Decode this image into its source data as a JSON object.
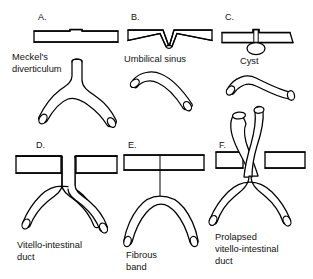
{
  "figure": {
    "background_color": "#ffffff",
    "ink_color": "#000000",
    "width": 313,
    "height": 279
  },
  "panels": [
    {
      "letter": "A.",
      "caption_line1": "Meckel's",
      "caption_line2": "diverticulum",
      "caption_full": "Meckel's diverticulum",
      "wall": "intact-hatched-wall-with-small-notch",
      "bowel": "y-shaped-loop-with-upward-diverticulum"
    },
    {
      "letter": "B.",
      "caption_line1": "Umbilical sinus",
      "caption_line2": "",
      "caption_full": "Umbilical sinus",
      "wall": "hatched-wall-with-v-shaped-invagination",
      "bowel": "elbow-shaped-bowel-loop"
    },
    {
      "letter": "C.",
      "caption_line1": "Cyst",
      "caption_line2": "",
      "caption_full": "Cyst",
      "wall": "hatched-wall-with-cyst-below",
      "bowel": "elbow-shaped-bowel-loop"
    },
    {
      "letter": "D.",
      "caption_line1": "Vitello-intestinal",
      "caption_line2": "duct",
      "caption_full": "Vitello-intestinal duct",
      "wall": "hatched-wall-with-gap-defect",
      "bowel": "y-shaped-loop-with-patent-duct"
    },
    {
      "letter": "E.",
      "caption_line1": "Fibrous",
      "caption_line2": "band",
      "caption_full": "Fibrous band",
      "wall": "intact-hatched-wall",
      "bowel": "y-shaped-loop-with-thin-fibrous-band"
    },
    {
      "letter": "F.",
      "caption_line1": "Prolapsed",
      "caption_line2": "vitello-intestinal",
      "caption_line3": "duct",
      "caption_full": "Prolapsed vitello-intestinal duct",
      "wall": "hatched-wall-with-gap-defect",
      "bowel": "y-shaped-loop-prolapsing-through-wall"
    }
  ]
}
